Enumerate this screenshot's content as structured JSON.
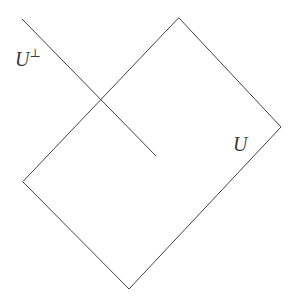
{
  "figure": {
    "background_color": "#ffffff",
    "stroke_color": "#444444",
    "stroke_width": 1,
    "width": 297,
    "height": 298
  },
  "shapes": {
    "subspace_square": {
      "name": "U",
      "kind": "tilted-square",
      "points": "179,18 281,127 129,289 23,182",
      "vertices": {
        "top": [
          179,
          18
        ],
        "right": [
          281,
          127
        ],
        "bottom": [
          129,
          289
        ],
        "left": [
          23,
          182
        ]
      }
    },
    "orthogonal_line": {
      "name": "U-perp",
      "kind": "line-segment",
      "x1": 22,
      "y1": 19,
      "x2": 156,
      "y2": 156,
      "intersection_with_square_edge": [
        102,
        100
      ]
    }
  },
  "labels": {
    "u_perp": {
      "base": "U",
      "superscript": "⊥",
      "full": "U⊥",
      "x": 15,
      "y": 48
    },
    "u": {
      "text": "U",
      "x": 233,
      "y": 134
    }
  }
}
